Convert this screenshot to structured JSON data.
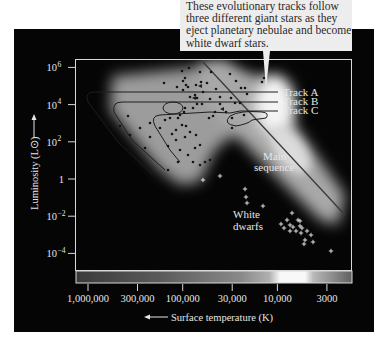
{
  "callout": {
    "lines": [
      "These evolutionary tracks follow",
      "three different giant stars as they",
      "eject planetary nebulae and become",
      "white dwarf stars."
    ]
  },
  "axes": {
    "y_label": "Luminosity (L⊙)",
    "x_label": "Surface temperature (K)",
    "y_ticks": [
      {
        "value": 1000000,
        "label": "10",
        "exp": "6"
      },
      {
        "value": 10000,
        "label": "10",
        "exp": "4"
      },
      {
        "value": 100,
        "label": "10",
        "exp": "2"
      },
      {
        "value": 1,
        "label": "1",
        "exp": ""
      },
      {
        "value": 0.01,
        "label": "10",
        "exp": "−2"
      },
      {
        "value": 0.0001,
        "label": "10",
        "exp": "−4"
      }
    ],
    "x_ticks": [
      {
        "value": 1000000,
        "label": "1,000,000"
      },
      {
        "value": 300000,
        "label": "300,000"
      },
      {
        "value": 100000,
        "label": "100,000"
      },
      {
        "value": 30000,
        "label": "30,000"
      },
      {
        "value": 10000,
        "label": "10,000"
      },
      {
        "value": 3000,
        "label": "3000"
      }
    ],
    "x_direction": "decreasing to the right",
    "y_scale": "log",
    "x_scale": "log"
  },
  "annotations": {
    "track_a": "Track A",
    "track_b": "Track B",
    "track_c": "Track C",
    "main_sequence_line1": "Main",
    "main_sequence_line2": "sequence",
    "white_dwarfs_line1": "White",
    "white_dwarfs_line2": "dwarfs"
  },
  "regions": {
    "giant_stars": {
      "marker": "dot",
      "count_approx": 75
    },
    "white_dwarfs": {
      "marker": "plus",
      "count_approx": 24
    }
  },
  "colors": {
    "panel": "#050505",
    "frame": "#d8d8d8",
    "callout_bg": "#ededed",
    "callout_text": "#2a2a2a",
    "glow": "#bdbdbd",
    "label": "#e6e6e6"
  }
}
